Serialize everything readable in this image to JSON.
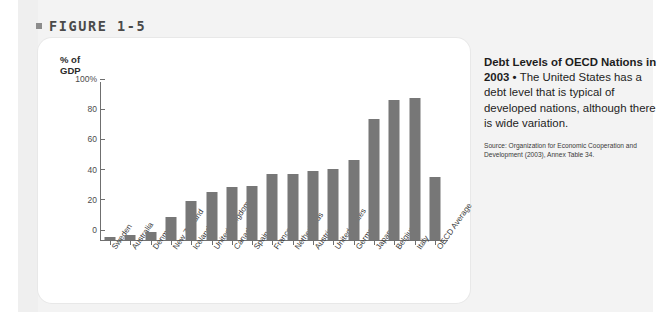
{
  "figure": {
    "bullet_icon": "square-bullet-icon",
    "label": "FIGURE 1-5"
  },
  "chart_data": {
    "type": "bar",
    "title": "Debt Levels of OECD Nations in 2003",
    "xlabel": "",
    "ylabel": "% of\nGDP",
    "ylim": [
      0,
      100
    ],
    "yticks": [
      "0",
      "20",
      "40",
      "60",
      "80",
      "100%"
    ],
    "ytick_values": [
      0,
      20,
      40,
      60,
      80,
      100
    ],
    "grid": false,
    "legend": "none",
    "bar_color": "#777777",
    "axis_color": "#6f6f6f",
    "categories": [
      "Sweden",
      "Australia",
      "Denmark",
      "New Zealand",
      "Iceland",
      "United Kingdom",
      "Canada",
      "Spain",
      "France",
      "Netherlands",
      "Austria",
      "United States",
      "Germany",
      "Japan",
      "Belgium",
      "Italy",
      "OECD Average"
    ],
    "values": [
      2,
      3,
      5,
      15,
      26,
      32,
      35,
      36,
      44,
      44,
      46,
      47,
      53,
      80,
      93,
      94,
      42
    ]
  },
  "caption": {
    "title": "Debt Levels of OECD Nations in 2003",
    "separator": " • ",
    "body": "The United States has a debt level that is typical of developed nations, although there is wide variation.",
    "source": "Source: Organization for Economic Cooperation and Development (2003), Annex Table 34."
  }
}
